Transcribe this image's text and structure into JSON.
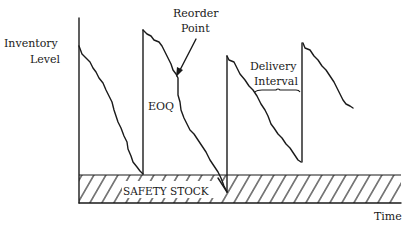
{
  "diagram": {
    "labels": {
      "y_axis_line1": "Inventory",
      "y_axis_line2": "Level",
      "x_axis": "Time",
      "reorder_line1": "Reorder",
      "reorder_line2": "Point",
      "eoq": "EOQ",
      "delivery_line1": "Delivery",
      "delivery_line2": "Interval",
      "safety_stock": "SAFETY STOCK"
    },
    "cycles": [
      {
        "name": "cycle-1",
        "note": "depletion from initial level to safety stock, then replenished"
      },
      {
        "name": "cycle-2",
        "note": "depletion dips into safety stock before delivery"
      },
      {
        "name": "cycle-3",
        "note": "delivery arrives above safety stock"
      },
      {
        "name": "cycle-4",
        "note": "ongoing depletion"
      }
    ],
    "colors": {
      "ink": "#1a1a1a",
      "background": "#ffffff"
    }
  }
}
